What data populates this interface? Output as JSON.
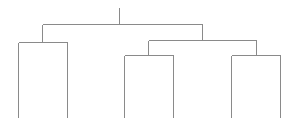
{
  "diagram": {
    "type": "dendrogram",
    "line_color": "#8a8a8a",
    "background": "#ffffff",
    "leaves": [
      {
        "id": "leaf-1",
        "x": 18
      },
      {
        "id": "leaf-2",
        "x": 67
      },
      {
        "id": "leaf-3",
        "x": 124
      },
      {
        "id": "leaf-4",
        "x": 173
      },
      {
        "id": "leaf-5",
        "x": 231
      },
      {
        "id": "leaf-6",
        "x": 280
      }
    ],
    "leaf_bottom_y": 117,
    "nodes": [
      {
        "id": "root",
        "x": 119,
        "y": 24,
        "stem_top": 7,
        "children": [
          "node-left",
          "node-right"
        ]
      },
      {
        "id": "node-left",
        "x": 42,
        "y": 42,
        "children": [
          "leaf-1",
          "leaf-2"
        ]
      },
      {
        "id": "node-right",
        "x": 202,
        "y": 40,
        "children": [
          "node-mid",
          "node-far-right"
        ]
      },
      {
        "id": "node-mid",
        "x": 148,
        "y": 55,
        "children": [
          "leaf-3",
          "leaf-4"
        ]
      },
      {
        "id": "node-far-right",
        "x": 256,
        "y": 55,
        "children": [
          "leaf-5",
          "leaf-6"
        ]
      }
    ]
  }
}
